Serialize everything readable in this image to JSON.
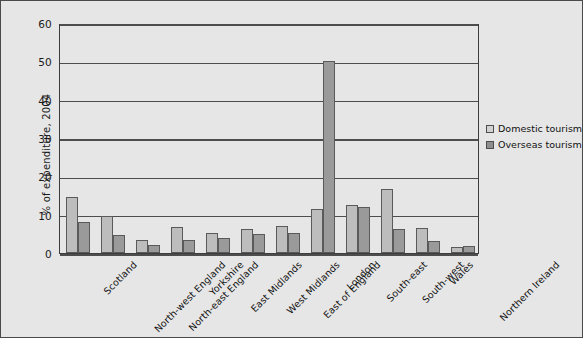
{
  "chart_data": {
    "type": "bar",
    "title": "",
    "xlabel": "",
    "ylabel": "% of expenditure, 2004",
    "ylim": [
      0,
      60
    ],
    "yticks": [
      0,
      10,
      20,
      30,
      40,
      50,
      60
    ],
    "grid": true,
    "legend_position": "right",
    "categories": [
      "Scotland",
      "North-west England",
      "North-east England",
      "Yorkshire",
      "East Midlands",
      "West Midlands",
      "East of England",
      "London",
      "South-east",
      "South-west",
      "Wales",
      "Northern Ireland"
    ],
    "series": [
      {
        "name": "Domestic tourism",
        "color": "#bdbdbd",
        "values": [
          14.6,
          9.7,
          3.3,
          6.8,
          5.2,
          6.3,
          7.0,
          11.4,
          12.4,
          16.8,
          6.6,
          1.5
        ]
      },
      {
        "name": "Overseas tourism",
        "color": "#9a9a9a",
        "values": [
          8.2,
          4.8,
          2.1,
          3.4,
          4.0,
          4.9,
          5.3,
          50.0,
          11.9,
          6.2,
          3.2,
          1.8
        ]
      }
    ]
  },
  "legend": {
    "items": [
      {
        "label": "Domestic tourism"
      },
      {
        "label": "Overseas tourism"
      }
    ]
  },
  "colors": {
    "figure_background": "#e6e6e6",
    "axis": "#3d3d3d",
    "domestic": "#bdbdbd",
    "overseas": "#9a9a9a"
  }
}
